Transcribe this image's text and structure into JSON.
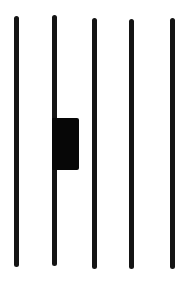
{
  "figure": {
    "colors": {
      "background": "#ffffff",
      "stroke": "#141414",
      "block": "#070707"
    },
    "strokes": [
      {
        "x": 14,
        "top": 16,
        "bottom": 267,
        "width": 5
      },
      {
        "x": 52,
        "top": 15,
        "bottom": 266,
        "width": 5
      },
      {
        "x": 92,
        "top": 18,
        "bottom": 269,
        "width": 5
      },
      {
        "x": 129,
        "top": 19,
        "bottom": 269,
        "width": 5
      },
      {
        "x": 170,
        "top": 18,
        "bottom": 269,
        "width": 5
      }
    ],
    "block": {
      "x": 52,
      "top": 118,
      "bottom": 170,
      "right": 79,
      "attached_to_stroke": 2
    }
  }
}
